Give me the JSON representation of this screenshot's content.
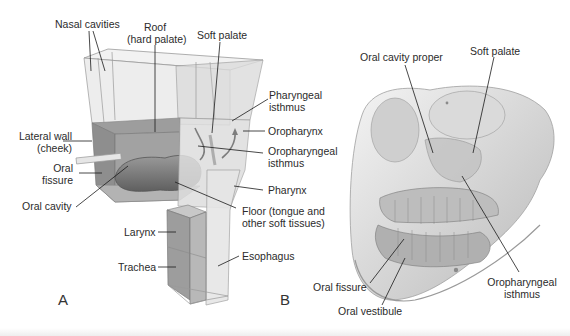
{
  "figure": {
    "panel_a": {
      "letter": "A",
      "labels": {
        "nasal_cavities": "Nasal cavities",
        "roof_line1": "Roof",
        "roof_line2": "(hard palate)",
        "soft_palate": "Soft palate",
        "pharyngeal_isthmus_line1": "Pharyngeal",
        "pharyngeal_isthmus_line2": "isthmus",
        "oropharynx": "Oropharynx",
        "oropharyngeal_isthmus_line1": "Oropharyngeal",
        "oropharyngeal_isthmus_line2": "isthmus",
        "lateral_wall_line1": "Lateral wall",
        "lateral_wall_line2": "(cheek)",
        "oral_fissure_line1": "Oral",
        "oral_fissure_line2": "fissure",
        "oral_cavity": "Oral cavity",
        "pharynx": "Pharynx",
        "floor_line1": "Floor (tongue and",
        "floor_line2": "other soft tissues)",
        "larynx": "Larynx",
        "trachea": "Trachea",
        "esophagus": "Esophagus"
      }
    },
    "panel_b": {
      "letter": "B",
      "labels": {
        "oral_cavity_proper": "Oral cavity proper",
        "soft_palate": "Soft palate",
        "oral_fissure": "Oral fissure",
        "oral_vestibule": "Oral vestibule",
        "oropharyngeal_isthmus_line1": "Oropharyngeal",
        "oropharyngeal_isthmus_line2": "isthmus"
      }
    },
    "colors": {
      "box_fill": "#e9e9e9",
      "box_edge": "#9a9a9a",
      "oral_fill": "#8a8a8a",
      "tongue": "#777777",
      "leader": "#1a1a1a",
      "text": "#2b2b2b"
    }
  }
}
